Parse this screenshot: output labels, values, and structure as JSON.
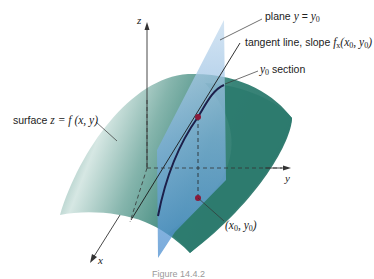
{
  "figure": {
    "axes": {
      "x": "x",
      "y": "y",
      "z": "z"
    },
    "labels": {
      "plane": {
        "text": "plane",
        "eq_lhs": "y",
        "eq": " = ",
        "eq_rhs": "y",
        "sub": "0"
      },
      "tangent": {
        "text": "tangent line, slope ",
        "f": "f",
        "fsub": "x",
        "args_open": "(x",
        "sub0a": "0",
        "comma": ", y",
        "sub0b": "0",
        "close": ")"
      },
      "section": {
        "y": "y",
        "sub": "0",
        "text": " section"
      },
      "surface": {
        "text": "surface ",
        "eq": "z = f (x, y)"
      },
      "point": {
        "open": "(x",
        "sub0a": "0",
        "comma": ", y",
        "sub0b": "0",
        "close": ")"
      }
    },
    "caption": "Figure 14.4.2"
  },
  "colors": {
    "surface_dark": "#2e7f72",
    "surface_light": "#cfe3df",
    "plane": "#5b9bd5",
    "plane_light": "#b7d3ea",
    "curve": "#1c1f4a",
    "point": "#8b1a3a",
    "axis": "#333333"
  }
}
